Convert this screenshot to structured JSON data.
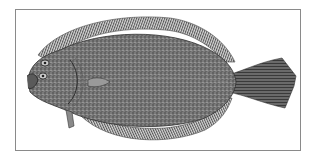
{
  "image": {
    "subject": "flounder illustration",
    "style": "engraving",
    "colors": {
      "background": "#ffffff",
      "frame": "#8a8a8a",
      "body": "#6e6e6e",
      "fin": "#8c8c8c",
      "ink": "#2e2e2e"
    }
  }
}
